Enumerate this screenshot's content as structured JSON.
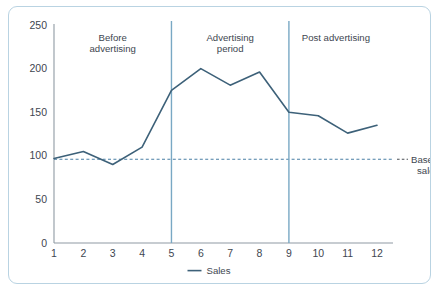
{
  "figure": {
    "border_color": "#b9d3e2",
    "background": "#ffffff",
    "caption": ""
  },
  "chart_data": {
    "type": "line",
    "title": "",
    "subtitle": "",
    "xlabel": "",
    "ylabel": "",
    "x": [
      1,
      2,
      3,
      4,
      5,
      6,
      7,
      8,
      9,
      10,
      11,
      12
    ],
    "xticklabels": [
      "1",
      "2",
      "3",
      "4",
      "5",
      "6",
      "7",
      "8",
      "9",
      "10",
      "11",
      "12"
    ],
    "yticks": [
      0,
      50,
      100,
      150,
      200,
      250
    ],
    "yticklabels": [
      "0",
      "50",
      "100",
      "150",
      "200",
      "250"
    ],
    "xlim": [
      1,
      12
    ],
    "ylim": [
      0,
      250
    ],
    "grid": false,
    "legend_position": "bottom",
    "series": [
      {
        "name": "Sales",
        "color": "#3d6179",
        "values": [
          97,
          105,
          90,
          110,
          175,
          200,
          181,
          196,
          150,
          146,
          126,
          135
        ]
      }
    ],
    "reference_lines": [
      {
        "name": "Base line sales",
        "orientation": "horizontal",
        "value": 96,
        "style": "dashed",
        "color": "#4a7fa5",
        "label": "Base line sales",
        "label_line1": "Base line",
        "label_line2": "sales"
      },
      {
        "name": "advertising-start-divider",
        "orientation": "vertical",
        "value": 5,
        "style": "solid",
        "color": "#79a8c4",
        "label": ""
      },
      {
        "name": "advertising-end-divider",
        "orientation": "vertical",
        "value": 9,
        "style": "solid",
        "color": "#79a8c4",
        "label": ""
      }
    ],
    "annotations": [
      {
        "name": "before-advertising",
        "line1": "Before",
        "line2": "advertising",
        "x_center": 3,
        "y": 232
      },
      {
        "name": "advertising-period",
        "line1": "Advertising",
        "line2": "period",
        "x_center": 7,
        "y": 232
      },
      {
        "name": "post-advertising",
        "line1": "Post advertising",
        "line2": "",
        "x_center": 10.6,
        "y": 232
      }
    ],
    "legend": [
      {
        "label": "Sales",
        "color": "#3d6179",
        "marker": "line"
      }
    ]
  }
}
